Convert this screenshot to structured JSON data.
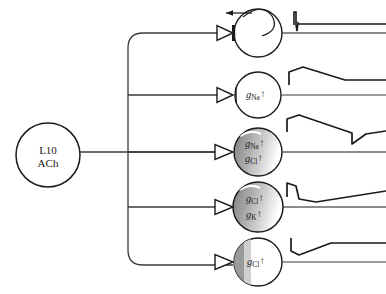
{
  "figure": {
    "title": ""
  },
  "presynaptic": {
    "name": "L10-ACh-neuron",
    "line1": "L10",
    "line2": "ACh",
    "cx": 48,
    "cy": 155,
    "r": 32
  },
  "targets": [
    {
      "id": "target-1",
      "label_lines": [],
      "cx": 258,
      "cy": 33,
      "r": 24,
      "shaded": false,
      "terminal": "filled-bar",
      "recurrent_arrow": true,
      "trace": "action-potential"
    },
    {
      "id": "target-2",
      "label_lines": [
        {
          "symbol": "g",
          "sub": "Na",
          "arrow": "↑"
        }
      ],
      "cx": 258,
      "cy": 95,
      "r": 23,
      "shaded": false,
      "terminal": "open-bar",
      "recurrent_arrow": false,
      "trace": "epsp"
    },
    {
      "id": "target-3",
      "label_lines": [
        {
          "symbol": "g",
          "sub": "Na",
          "arrow": "↑"
        },
        {
          "symbol": "g",
          "sub": "Cl",
          "arrow": "↑"
        }
      ],
      "cx": 258,
      "cy": 152,
      "r": 24,
      "shaded": true,
      "terminal": "open",
      "recurrent_arrow": false,
      "trace": "biphasic"
    },
    {
      "id": "target-4",
      "label_lines": [
        {
          "symbol": "g",
          "sub": "Cl",
          "arrow": "↑"
        },
        {
          "symbol": "g",
          "sub": "K",
          "arrow": "↑"
        }
      ],
      "cx": 258,
      "cy": 207,
      "r": 25,
      "shaded": true,
      "terminal": "open",
      "recurrent_arrow": false,
      "trace": "fast-epsp-slow-ipsp"
    },
    {
      "id": "target-5",
      "label_lines": [
        {
          "symbol": "g",
          "sub": "Cl",
          "arrow": "↑"
        }
      ],
      "cx": 258,
      "cy": 262,
      "r": 24,
      "shaded": true,
      "terminal": "open-bar",
      "recurrent_arrow": false,
      "trace": "ipsp"
    }
  ],
  "colors": {
    "ink": "#1a1a1a",
    "line": "#3a3a3a",
    "shade_dark": "#8a8a8a",
    "shade_light": "#c9c9c9",
    "background": "#ffffff"
  }
}
